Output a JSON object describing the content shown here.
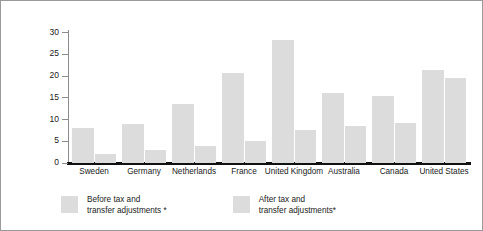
{
  "chart_data": {
    "type": "bar",
    "title": "",
    "xlabel": "",
    "ylabel": "Percent of children living in poverty",
    "ylim": [
      0,
      30
    ],
    "yticks": [
      0,
      5,
      10,
      15,
      20,
      25,
      30
    ],
    "grid": false,
    "legend_position": "bottom-left",
    "categories": [
      "Sweden",
      "Germany",
      "Netherlands",
      "France",
      "United Kingdom",
      "Australia",
      "Canada",
      "United States"
    ],
    "series": [
      {
        "name": "Before tax and transfer adjustments *",
        "values": [
          8.0,
          8.9,
          13.5,
          20.6,
          28.1,
          15.9,
          15.3,
          21.3
        ]
      },
      {
        "name": "After tax and transfer adjustments*",
        "values": [
          2.0,
          2.9,
          3.7,
          4.9,
          7.4,
          8.4,
          9.0,
          19.5
        ]
      }
    ],
    "colors": {
      "bar": "#dcdcdc",
      "axis": "#111111",
      "text": "#1a1a1a",
      "frame": "#9a9a9a"
    }
  },
  "legend": [
    {
      "line1": "Before tax and",
      "line2": "transfer adjustments *"
    },
    {
      "line1": "After tax and",
      "line2": "transfer  adjustments*"
    }
  ]
}
